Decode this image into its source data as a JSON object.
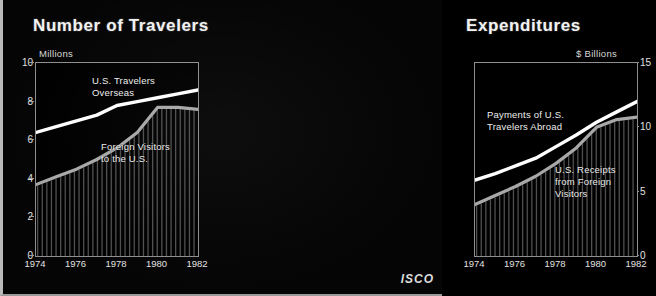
{
  "logo": "ISCO",
  "colors": {
    "background": "#050505",
    "plot_border": "#8f8f8f",
    "text": "#ededed",
    "series_upper": "#ffffff",
    "series_lower": "#a8a8a8",
    "hatch": "#6e6e6e"
  },
  "panels": [
    {
      "id": "travelers",
      "title": "Number of Travelers",
      "unit": "Millions",
      "note_upper": "U.S. Travelers\nOverseas",
      "note_lower": "Foreign Visitors\nto the U.S."
    },
    {
      "id": "expenditures",
      "title": "Expenditures",
      "unit": "$ Billions",
      "note_upper": "Payments of U.S.\nTravelers Abroad",
      "note_lower": "U.S. Receipts\nfrom Foreign\nVisitors"
    }
  ],
  "chart_data": [
    {
      "type": "line",
      "title": "Number of Travelers",
      "subtitle": "Millions",
      "xlabel": "",
      "ylabel": "Millions",
      "x": [
        1974,
        1975,
        1976,
        1977,
        1978,
        1979,
        1980,
        1981,
        1982
      ],
      "xticks": [
        1974,
        1976,
        1978,
        1980,
        1982
      ],
      "xlim": [
        1974,
        1982
      ],
      "yticks": [
        0,
        2,
        4,
        6,
        8,
        10
      ],
      "ylim": [
        0,
        10
      ],
      "grid": false,
      "legend": "inline-annotations",
      "series": [
        {
          "name": "U.S. Travelers Overseas",
          "values": [
            6.4,
            6.7,
            7.0,
            7.3,
            7.8,
            8.0,
            8.2,
            8.4,
            8.6
          ]
        },
        {
          "name": "Foreign Visitors to the U.S.",
          "values": [
            3.7,
            4.1,
            4.5,
            5.0,
            5.6,
            6.4,
            7.7,
            7.7,
            7.6
          ]
        }
      ]
    },
    {
      "type": "line",
      "title": "Expenditures",
      "subtitle": "$ Billions",
      "xlabel": "",
      "ylabel": "$ Billions",
      "x": [
        1974,
        1975,
        1976,
        1977,
        1978,
        1979,
        1980,
        1981,
        1982
      ],
      "xticks": [
        1974,
        1976,
        1978,
        1980,
        1982
      ],
      "xlim": [
        1974,
        1982
      ],
      "yticks": [
        0,
        5,
        10,
        15
      ],
      "ylim": [
        0,
        15
      ],
      "grid": false,
      "legend": "inline-annotations",
      "series": [
        {
          "name": "Payments of U.S. Travelers Abroad",
          "values": [
            5.9,
            6.4,
            7.0,
            7.6,
            8.5,
            9.4,
            10.4,
            11.2,
            12.0
          ]
        },
        {
          "name": "U.S. Receipts from Foreign Visitors",
          "values": [
            4.0,
            4.7,
            5.4,
            6.2,
            7.2,
            8.4,
            10.0,
            10.6,
            10.8
          ]
        }
      ]
    }
  ],
  "axes": {
    "left_yticks": [
      "10",
      "8",
      "6",
      "4",
      "2",
      "0"
    ],
    "right_yticks": [
      "15",
      "10",
      "5",
      "0"
    ],
    "xticks": [
      "1974",
      "1976",
      "1978",
      "1980",
      "1982"
    ]
  }
}
